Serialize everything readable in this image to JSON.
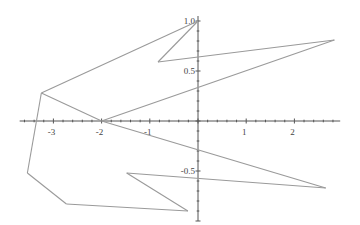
{
  "chart_data": {
    "type": "line",
    "title": "",
    "xlabel": "",
    "ylabel": "",
    "xlim": [
      -3.7,
      2.95
    ],
    "ylim": [
      -1.0,
      1.05
    ],
    "grid": false,
    "legend": "none",
    "line_color": "#9a9a9a",
    "axis_color": "#555555",
    "x_ticks": [
      {
        "value": -3,
        "label": "-3"
      },
      {
        "value": -2,
        "label": "-2"
      },
      {
        "value": -1,
        "label": "-1"
      },
      {
        "value": 1,
        "label": "1"
      },
      {
        "value": 2,
        "label": "2"
      }
    ],
    "y_ticks": [
      {
        "value": 1.0,
        "label": "1.0"
      },
      {
        "value": 0.5,
        "label": "0.5"
      },
      {
        "value": -0.5,
        "label": "-0.5"
      }
    ],
    "x_minor_step": 0.2,
    "y_minor_step": 0.1,
    "series": [
      {
        "name": "path",
        "points": [
          [
            -2.0,
            0.0
          ],
          [
            -3.25,
            0.28
          ],
          [
            0.0,
            1.0
          ],
          [
            -0.83,
            0.59
          ],
          [
            2.83,
            0.81
          ],
          [
            -2.0,
            0.0
          ],
          [
            2.65,
            -0.67
          ],
          [
            -1.48,
            -0.52
          ],
          [
            -0.21,
            -0.9
          ],
          [
            -2.73,
            -0.83
          ],
          [
            -3.54,
            -0.52
          ],
          [
            -3.25,
            0.28
          ]
        ]
      }
    ]
  }
}
